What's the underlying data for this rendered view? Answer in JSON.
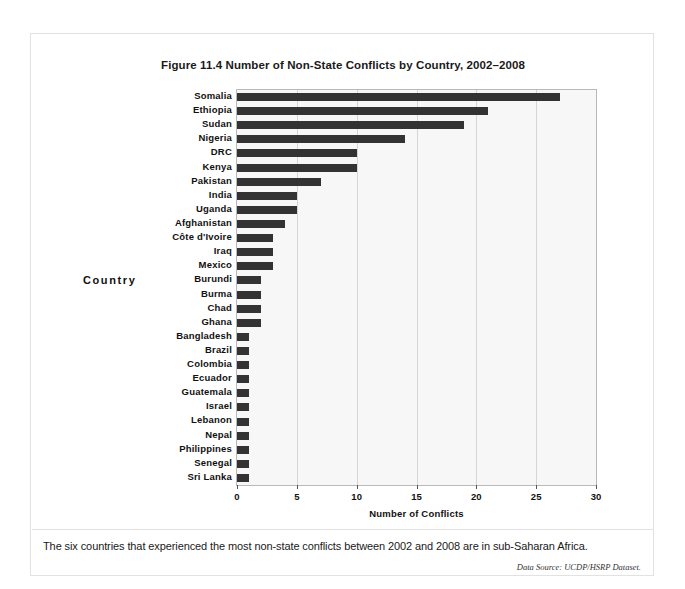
{
  "document": {
    "top_bleed_text": "",
    "caption": "The six countries that experienced the most non-state conflicts between 2002 and 2008 are in sub-Saharan Africa.",
    "source_note": "Data Source: UCDP/HSRP Dataset."
  },
  "chart_data": {
    "type": "bar",
    "orientation": "horizontal",
    "title": "Figure 11.4 Number of Non-State Conflicts by Country, 2002–2008",
    "xlabel": "Number of Conflicts",
    "ylabel": "Country",
    "xlim": [
      0,
      30
    ],
    "xticks": [
      0,
      5,
      10,
      15,
      20,
      25,
      30
    ],
    "grid": true,
    "grid_axis": "x",
    "legend": "none",
    "bar_color": "#333333",
    "plot_background": "#f7f7f7",
    "categories": [
      "Somalia",
      "Ethiopia",
      "Sudan",
      "Nigeria",
      "DRC",
      "Kenya",
      "Pakistan",
      "India",
      "Uganda",
      "Afghanistan",
      "Côte d'Ivoire",
      "Iraq",
      "Mexico",
      "Burundi",
      "Burma",
      "Chad",
      "Ghana",
      "Bangladesh",
      "Brazil",
      "Colombia",
      "Ecuador",
      "Guatemala",
      "Israel",
      "Lebanon",
      "Nepal",
      "Philippines",
      "Senegal",
      "Sri Lanka"
    ],
    "values": [
      27,
      21,
      19,
      14,
      10,
      10,
      7,
      5,
      5,
      4,
      3,
      3,
      3,
      2,
      2,
      2,
      2,
      1,
      1,
      1,
      1,
      1,
      1,
      1,
      1,
      1,
      1,
      1
    ]
  }
}
